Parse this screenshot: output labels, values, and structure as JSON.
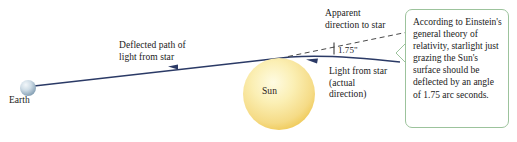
{
  "figure": {
    "background_color": "#ffffff"
  },
  "bodies": {
    "earth": {
      "label": "Earth",
      "center": [
        28,
        88
      ],
      "radius": 8,
      "color_core": "#e8eff5",
      "color_edge": "#7f9bb0"
    },
    "sun": {
      "label": "Sun",
      "center": [
        279,
        94
      ],
      "radius": 36,
      "color_core": "#fdf6d2",
      "color_edge": "#efc64a"
    }
  },
  "annotations": {
    "deflected_path": "Deflected path of\nlight from star",
    "apparent_direction": "Apparent\ndirection to star",
    "actual_direction": "Light from star\n(actual\ndirection)",
    "angle": "1.75\"",
    "callout": "According to Einstein's general theory of relativity, starlight just grazing the Sun's surface should be deflected by an angle of 1.75 arc seconds."
  },
  "colors": {
    "ray": "#2b3a66",
    "dashed": "#4a4a4a",
    "callout_border": "#9cc39c",
    "text": "#1a1a1a"
  },
  "icons": {
    "earth": "earth-sphere-icon",
    "sun": "sun-sphere-icon",
    "arrow_left_deflected": "arrow-left-icon",
    "arrow_left_actual": "arrow-left-icon"
  }
}
